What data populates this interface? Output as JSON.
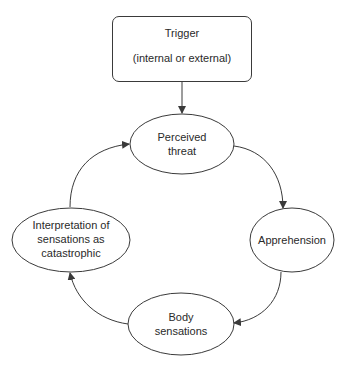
{
  "diagram": {
    "trigger": {
      "title": "Trigger",
      "subtitle": "(internal or external)"
    },
    "nodes": [
      {
        "id": "perceived-threat",
        "lines": [
          "Perceived",
          "threat"
        ]
      },
      {
        "id": "apprehension",
        "lines": [
          "Apprehension"
        ]
      },
      {
        "id": "body-sensations",
        "lines": [
          "Body",
          "sensations"
        ]
      },
      {
        "id": "interpretation",
        "lines": [
          "Interpretation of",
          "sensations as",
          "catastrophic"
        ]
      }
    ],
    "edges": [
      {
        "from": "trigger",
        "to": "perceived-threat"
      },
      {
        "from": "perceived-threat",
        "to": "apprehension"
      },
      {
        "from": "apprehension",
        "to": "body-sensations"
      },
      {
        "from": "body-sensations",
        "to": "interpretation"
      },
      {
        "from": "interpretation",
        "to": "perceived-threat"
      }
    ],
    "colors": {
      "stroke": "#3a3a3a",
      "background": "#ffffff",
      "text": "#2a2a2a"
    }
  }
}
